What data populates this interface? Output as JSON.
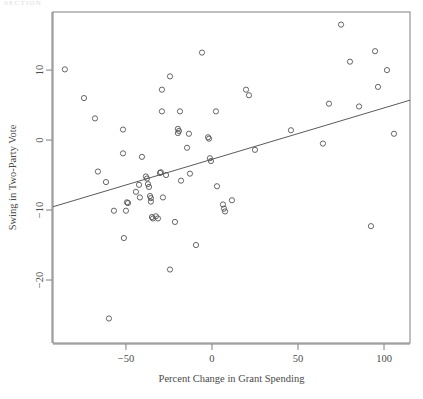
{
  "header": {
    "faint_text": "SECTION"
  },
  "chart_data": {
    "type": "scatter",
    "title": "",
    "xlabel": "Percent Change in Grant Spending",
    "ylabel": "Swing in Two-Party Vote",
    "xlim": [
      -92.4,
      115.1
    ],
    "ylim": [
      -29.0,
      18.3
    ],
    "xticks": [
      -50,
      0,
      50,
      100
    ],
    "xtick_labels": [
      "−50",
      "0",
      "50",
      "100"
    ],
    "yticks": [
      10,
      0,
      -10,
      -20
    ],
    "ytick_labels": [
      "10",
      "0",
      "−10",
      "−20"
    ],
    "grid": false,
    "legend": null,
    "marker": "open-circle",
    "marker_color": "#555555",
    "marker_radius": 2.6,
    "frame_color": "#808080",
    "points": [
      {
        "x": -85.5,
        "y": 10.1
      },
      {
        "x": -74.4,
        "y": 6.0
      },
      {
        "x": -68.0,
        "y": 3.1
      },
      {
        "x": -66.3,
        "y": -4.5
      },
      {
        "x": -61.6,
        "y": -6.0
      },
      {
        "x": -59.9,
        "y": -25.5
      },
      {
        "x": -57.0,
        "y": -10.1
      },
      {
        "x": -51.7,
        "y": 1.5
      },
      {
        "x": -51.7,
        "y": -1.9
      },
      {
        "x": -51.2,
        "y": -14.0
      },
      {
        "x": -50.0,
        "y": -10.1
      },
      {
        "x": -49.4,
        "y": -8.9
      },
      {
        "x": -48.8,
        "y": -9.0
      },
      {
        "x": -44.2,
        "y": -7.4
      },
      {
        "x": -42.4,
        "y": -6.4
      },
      {
        "x": -41.9,
        "y": -8.2
      },
      {
        "x": -40.7,
        "y": -2.4
      },
      {
        "x": -38.4,
        "y": -5.2
      },
      {
        "x": -37.8,
        "y": -5.5
      },
      {
        "x": -37.2,
        "y": -6.3
      },
      {
        "x": -36.6,
        "y": -6.7
      },
      {
        "x": -36.0,
        "y": -8.0
      },
      {
        "x": -35.5,
        "y": -8.3
      },
      {
        "x": -35.5,
        "y": -8.8
      },
      {
        "x": -34.9,
        "y": -11.0
      },
      {
        "x": -34.3,
        "y": -11.2
      },
      {
        "x": -32.6,
        "y": -10.9
      },
      {
        "x": -31.4,
        "y": -11.2
      },
      {
        "x": -30.2,
        "y": -4.7
      },
      {
        "x": -29.7,
        "y": -4.6
      },
      {
        "x": -29.1,
        "y": 7.2
      },
      {
        "x": -29.1,
        "y": 4.1
      },
      {
        "x": -28.5,
        "y": -8.2
      },
      {
        "x": -26.7,
        "y": -5.0
      },
      {
        "x": -24.4,
        "y": 9.1
      },
      {
        "x": -24.4,
        "y": -18.5
      },
      {
        "x": -21.5,
        "y": -11.7
      },
      {
        "x": -19.8,
        "y": 1.6
      },
      {
        "x": -19.8,
        "y": 1.0
      },
      {
        "x": -19.2,
        "y": 1.3
      },
      {
        "x": -18.6,
        "y": 4.1
      },
      {
        "x": -18.0,
        "y": -5.8
      },
      {
        "x": -14.5,
        "y": -1.1
      },
      {
        "x": -13.4,
        "y": 0.9
      },
      {
        "x": -12.8,
        "y": -4.8
      },
      {
        "x": -9.3,
        "y": -15.0
      },
      {
        "x": -5.8,
        "y": 12.5
      },
      {
        "x": -2.3,
        "y": 0.4
      },
      {
        "x": -1.7,
        "y": 0.2
      },
      {
        "x": -1.2,
        "y": -2.6
      },
      {
        "x": -0.6,
        "y": -3.0
      },
      {
        "x": 2.3,
        "y": 4.1
      },
      {
        "x": 2.9,
        "y": -6.6
      },
      {
        "x": 6.4,
        "y": -9.2
      },
      {
        "x": 7.0,
        "y": -9.8
      },
      {
        "x": 7.6,
        "y": -10.2
      },
      {
        "x": 11.6,
        "y": -8.6
      },
      {
        "x": 19.8,
        "y": 7.2
      },
      {
        "x": 21.5,
        "y": 6.4
      },
      {
        "x": 25.0,
        "y": -1.4
      },
      {
        "x": 45.9,
        "y": 1.4
      },
      {
        "x": 64.5,
        "y": -0.5
      },
      {
        "x": 68.0,
        "y": 5.2
      },
      {
        "x": 75.0,
        "y": 16.5
      },
      {
        "x": 80.2,
        "y": 11.2
      },
      {
        "x": 85.5,
        "y": 4.8
      },
      {
        "x": 92.4,
        "y": -12.3
      },
      {
        "x": 94.8,
        "y": 12.7
      },
      {
        "x": 96.5,
        "y": 7.6
      },
      {
        "x": 101.7,
        "y": 10.0
      },
      {
        "x": 105.8,
        "y": 0.9
      }
    ],
    "fit_line": {
      "type": "linear",
      "slope": 0.0734,
      "intercept": -2.75,
      "x_start": -92.4,
      "x_end": 115.1,
      "y_start": -9.53,
      "y_end": 5.7,
      "color": "#5a5a5a"
    }
  }
}
